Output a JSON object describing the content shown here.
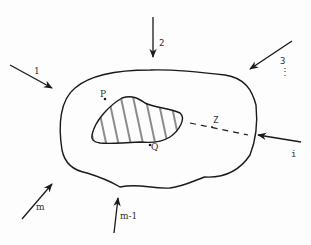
{
  "diagram": {
    "colors": {
      "ink": "#1a1a1a",
      "label": "#333333",
      "background": "#fdfdfd"
    },
    "body": {
      "name": "outer-region"
    },
    "inclusion": {
      "name": "hatched-inclusion",
      "pattern": "vertical-hatch"
    },
    "points": [
      {
        "id": "P",
        "label": "P"
      },
      {
        "id": "Q",
        "label": "Q"
      }
    ],
    "distance_line": {
      "label": "Z",
      "style": "dashed"
    },
    "loads": [
      {
        "label": "1"
      },
      {
        "label": "2"
      },
      {
        "label": "3"
      },
      {
        "label": "⋮"
      },
      {
        "label": "i"
      },
      {
        "label": "m-1"
      },
      {
        "label": "m"
      }
    ]
  }
}
